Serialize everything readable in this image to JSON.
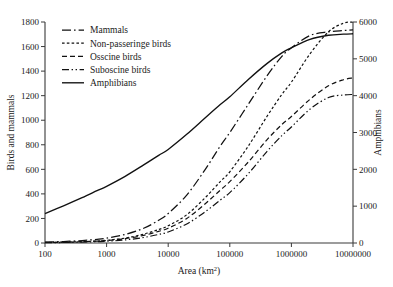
{
  "chart_data": {
    "type": "line",
    "title": "",
    "xlabel": "Area (km2)",
    "xlabel_base": "Area (km",
    "xlabel_sup": "2",
    "xlabel_close": ")",
    "ylabel_left": "Birds and mammals",
    "ylabel_right": "Amphibians",
    "xscale": "log",
    "xlim": [
      100,
      10000000
    ],
    "xticks": [
      100,
      1000,
      10000,
      100000,
      1000000,
      10000000
    ],
    "xticklabels": [
      "100",
      "1000",
      "10000",
      "100000",
      "1000000",
      "10000000"
    ],
    "ylim_left": [
      0,
      1800
    ],
    "yticks_left": [
      0,
      200,
      400,
      600,
      800,
      1000,
      1200,
      1400,
      1600,
      1800
    ],
    "yticklabels_left": [
      "0",
      "200",
      "400",
      "600",
      "800",
      "1000",
      "1200",
      "1400",
      "1600",
      "1800"
    ],
    "ylim_right": [
      0,
      6000
    ],
    "yticks_right": [
      0,
      1000,
      2000,
      3000,
      4000,
      5000,
      6000
    ],
    "yticklabels_right": [
      "0",
      "1000",
      "2000",
      "3000",
      "4000",
      "5000",
      "6000"
    ],
    "grid": false,
    "legend_position": "top-left",
    "series": [
      {
        "name": "Mammals",
        "axis": "left",
        "dash": "long-dash-dot",
        "x": [
          100,
          200,
          400,
          700,
          1000,
          2000,
          4000,
          7000,
          10000,
          20000,
          40000,
          70000,
          100000,
          200000,
          400000,
          700000,
          1000000,
          2000000,
          4000000,
          7000000,
          10000000
        ],
        "values": [
          8,
          12,
          20,
          30,
          40,
          70,
          120,
          185,
          240,
          390,
          600,
          790,
          900,
          1130,
          1360,
          1520,
          1590,
          1690,
          1720,
          1730,
          1735
        ]
      },
      {
        "name": "Non-passeringe birds",
        "axis": "left",
        "dash": "short-dash",
        "x": [
          100,
          200,
          400,
          700,
          1000,
          2000,
          4000,
          7000,
          10000,
          20000,
          40000,
          70000,
          100000,
          200000,
          400000,
          700000,
          1000000,
          2000000,
          4000000,
          7000000,
          10000000
        ],
        "values": [
          5,
          7,
          11,
          17,
          22,
          40,
          72,
          110,
          140,
          230,
          370,
          500,
          580,
          790,
          1030,
          1210,
          1310,
          1540,
          1720,
          1790,
          1800
        ]
      },
      {
        "name": "Osscine birds",
        "axis": "left",
        "dash": "medium-dash",
        "x": [
          100,
          200,
          400,
          700,
          1000,
          2000,
          4000,
          7000,
          10000,
          20000,
          40000,
          70000,
          100000,
          200000,
          400000,
          700000,
          1000000,
          2000000,
          4000000,
          7000000,
          10000000
        ],
        "values": [
          4,
          6,
          10,
          15,
          20,
          35,
          62,
          95,
          120,
          200,
          320,
          430,
          500,
          660,
          840,
          965,
          1030,
          1170,
          1280,
          1330,
          1345
        ]
      },
      {
        "name": "Suboscine birds",
        "axis": "left",
        "dash": "dash-dot-dot",
        "x": [
          100,
          200,
          400,
          700,
          1000,
          2000,
          4000,
          7000,
          10000,
          20000,
          40000,
          70000,
          100000,
          200000,
          400000,
          700000,
          1000000,
          2000000,
          4000000,
          7000000,
          10000000
        ],
        "values": [
          3,
          4,
          7,
          11,
          14,
          25,
          45,
          70,
          90,
          155,
          255,
          350,
          410,
          565,
          745,
          875,
          945,
          1090,
          1185,
          1205,
          1210
        ]
      },
      {
        "name": "Amphibians",
        "axis": "right",
        "dash": "solid",
        "x": [
          100,
          200,
          400,
          700,
          1000,
          2000,
          4000,
          7000,
          10000,
          20000,
          40000,
          70000,
          100000,
          200000,
          400000,
          700000,
          1000000,
          2000000,
          4000000,
          7000000,
          10000000
        ],
        "values": [
          800,
          1010,
          1230,
          1420,
          1540,
          1810,
          2120,
          2380,
          2540,
          2950,
          3400,
          3760,
          3970,
          4440,
          4870,
          5160,
          5300,
          5530,
          5640,
          5670,
          5680
        ]
      }
    ]
  },
  "legend": {
    "items": [
      {
        "label": "Mammals",
        "dash": "long-dash-dot"
      },
      {
        "label": "Non-passeringe birds",
        "dash": "short-dash"
      },
      {
        "label": "Osscine birds",
        "dash": "medium-dash"
      },
      {
        "label": "Suboscine birds",
        "dash": "dash-dot-dot"
      },
      {
        "label": "Amphibians",
        "dash": "solid"
      }
    ]
  }
}
